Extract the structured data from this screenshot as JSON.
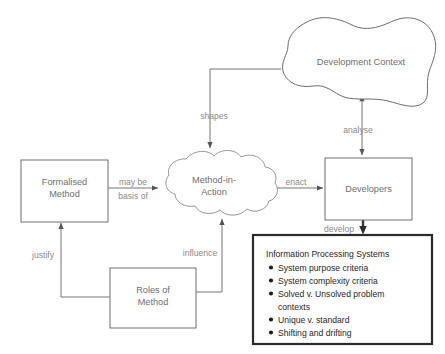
{
  "diagram": {
    "nodes": {
      "formalised_method": {
        "label_line1": "Formalised",
        "label_line2": "Method"
      },
      "method_in_action": {
        "label_line1": "Method-in-",
        "label_line2": "Action"
      },
      "development_context": {
        "label": "Development Context"
      },
      "developers": {
        "label": "Developers"
      },
      "roles_of_method": {
        "label_line1": "Roles of",
        "label_line2": "Method"
      }
    },
    "edges": {
      "shapes": {
        "label": "shapes"
      },
      "analyse": {
        "label": "analyse"
      },
      "may_be_basis_of": {
        "label_line1": "may be",
        "label_line2": "basis of"
      },
      "enact": {
        "label": "enact"
      },
      "develop": {
        "label": "develop"
      },
      "justify": {
        "label": "justify"
      },
      "influence": {
        "label": "influence"
      }
    },
    "info_box": {
      "title": "Information Processing Systems",
      "items": [
        {
          "line1": "System purpose criteria",
          "line2": ""
        },
        {
          "line1": "System complexity criteria",
          "line2": ""
        },
        {
          "line1": "Solved v. Unsolved problem",
          "line2": "contexts"
        },
        {
          "line1": "Unique v. standard",
          "line2": ""
        },
        {
          "line1": "Shifting and drifting",
          "line2": ""
        }
      ]
    },
    "colors": {
      "background": "#ffffff",
      "box_stroke": "#6e6e6e",
      "connector": "#777777",
      "info_border": "#2b2b2b",
      "node_text": "#6f6f6f",
      "info_text": "#1f1f1f"
    }
  }
}
